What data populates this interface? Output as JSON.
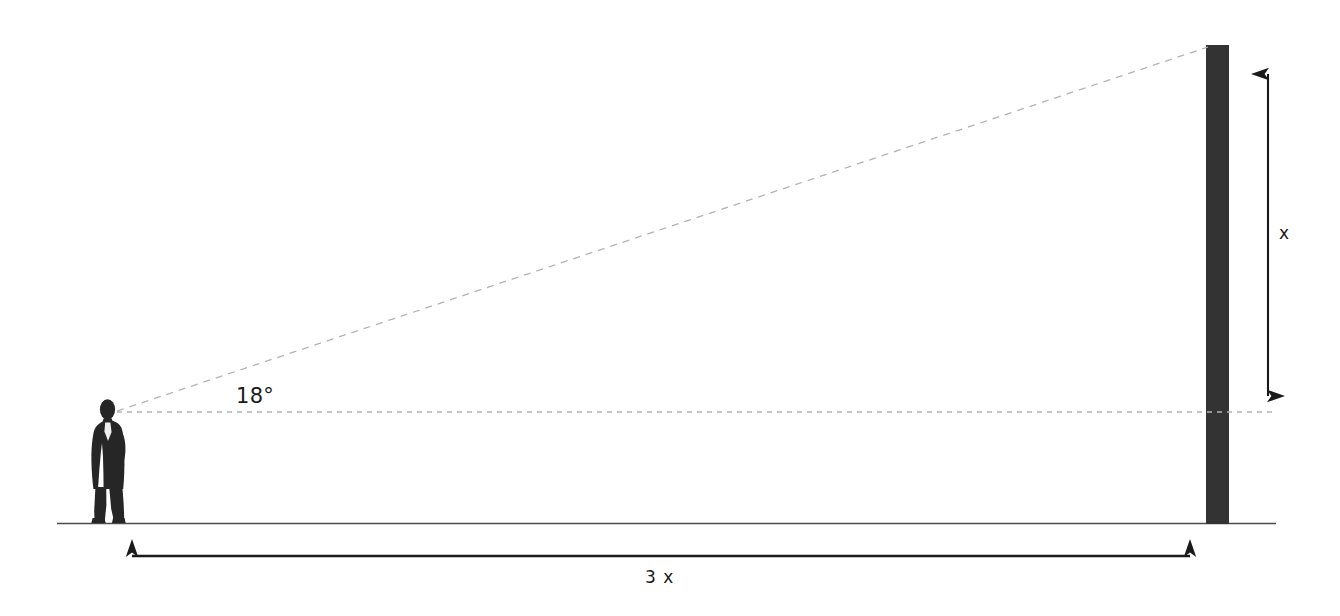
{
  "diagram": {
    "type": "geometry-trigonometry-diagram",
    "colors": {
      "tower_fill": "#333333",
      "person_fill": "#262626",
      "ground_line": "#4d4d4d",
      "dashed_line": "#b3b3b3",
      "arrow": "#1a1a1a",
      "label_text": "#1a1a1a",
      "background": "#ffffff"
    },
    "labels": {
      "angle": "18°",
      "height": "x",
      "distance": "3 x"
    },
    "elements": {
      "person_name": "businessman-silhouette",
      "tower_name": "vertical-tower",
      "ground_name": "ground-line",
      "sightline_name": "line-of-sight-dashed",
      "horizontal_name": "horizontal-reference-dashed",
      "height_arrow_name": "height-dimension-arrow",
      "distance_arrow_name": "distance-dimension-arrow"
    },
    "geometry": {
      "observer_eye": {
        "x": 117,
        "y": 412
      },
      "tower_top": {
        "x": 1207,
        "y": 45
      },
      "tower_base": {
        "x": 1207,
        "y": 523
      },
      "tower_width": 23,
      "ground_y": 523,
      "ground_x_start": 57,
      "ground_x_end": 1276,
      "height_arrow_x": 1268,
      "height_arrow_top_y": 57,
      "height_arrow_bottom_y": 413,
      "distance_arrow_y": 556,
      "distance_arrow_x_start": 114,
      "distance_arrow_x_end": 1208,
      "angle_degrees": 18
    }
  }
}
